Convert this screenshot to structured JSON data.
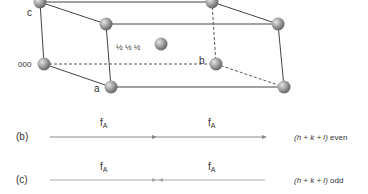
{
  "cell": {
    "labels": {
      "c": "c",
      "origin": "000",
      "a": "a",
      "b": "b",
      "body_center": "½ ½ ½"
    },
    "atom_color": "#8a8a8a"
  },
  "diagram_b": {
    "tag": "(b)",
    "segment1_label": "f",
    "segment1_sub": "A",
    "segment2_label": "f",
    "segment2_sub": "A",
    "condition_expr": "(h + k + l)",
    "condition_word": "even"
  },
  "diagram_c": {
    "tag": "(c)",
    "segment1_label": "f",
    "segment1_sub": "A",
    "segment2_label": "f",
    "segment2_sub": "A",
    "condition_expr": "(h + k + l)",
    "condition_word": "odd"
  }
}
